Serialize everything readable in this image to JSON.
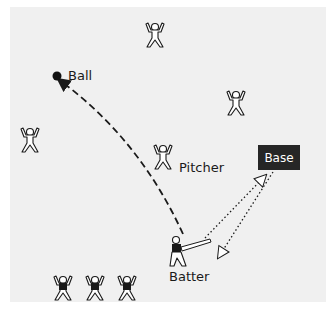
{
  "diagram": {
    "labels": {
      "ball": "Ball",
      "pitcher": "Pitcher",
      "batter": "Batter",
      "base": "Base"
    },
    "figures": [
      {
        "role": "fielder",
        "x": 155,
        "y": 35,
        "shirt": "white"
      },
      {
        "role": "fielder",
        "x": 236,
        "y": 103,
        "shirt": "white"
      },
      {
        "role": "fielder",
        "x": 30,
        "y": 140,
        "shirt": "white"
      },
      {
        "role": "pitcher",
        "x": 163,
        "y": 157,
        "shirt": "white"
      },
      {
        "role": "batter",
        "x": 180,
        "y": 255,
        "shirt": "black"
      },
      {
        "role": "waiting-batter",
        "x": 63,
        "y": 288,
        "shirt": "black"
      },
      {
        "role": "waiting-batter",
        "x": 95,
        "y": 288,
        "shirt": "black"
      },
      {
        "role": "waiting-batter",
        "x": 127,
        "y": 288,
        "shirt": "black"
      }
    ],
    "arrows": [
      {
        "name": "hit-path",
        "style": "dashed",
        "from": "batter",
        "to": "ball"
      },
      {
        "name": "run-to-base",
        "style": "dotted",
        "from": "batter",
        "to": "base"
      },
      {
        "name": "run-back",
        "style": "dotted",
        "from": "base",
        "to": "batter"
      }
    ],
    "colors": {
      "background": "#f0f0f0",
      "base_box": "#262626",
      "ink": "#1a1a1a"
    }
  }
}
